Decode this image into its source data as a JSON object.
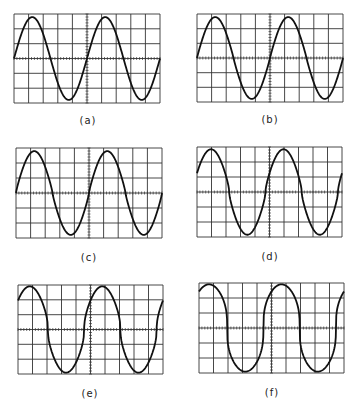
{
  "figure": {
    "grid": {
      "columns": 10,
      "rows": 6
    },
    "colors": {
      "grid": "#333333",
      "trace": "#111111",
      "background": "#ffffff"
    },
    "panels": [
      {
        "id": "a",
        "label": "(a)",
        "x": 14,
        "y": 14,
        "w": 146,
        "h": 89,
        "label_x": 88,
        "label_y": 115,
        "phase": 0.0,
        "amp": 0.93,
        "shape": 0.0
      },
      {
        "id": "b",
        "label": "(b)",
        "x": 197,
        "y": 14,
        "w": 146,
        "h": 88,
        "label_x": 270,
        "label_y": 114,
        "phase": 0.0,
        "amp": 0.93,
        "shape": 0.15
      },
      {
        "id": "c",
        "label": "(c)",
        "x": 16,
        "y": 148,
        "w": 146,
        "h": 90,
        "label_x": 89,
        "label_y": 252,
        "phase": 0.0,
        "amp": 0.93,
        "shape": 0.25
      },
      {
        "id": "d",
        "label": "(d)",
        "x": 197,
        "y": 147,
        "w": 145,
        "h": 90,
        "label_x": 270,
        "label_y": 251,
        "phase": 0.35,
        "amp": 0.95,
        "shape": 0.4
      },
      {
        "id": "e",
        "label": "(e)",
        "x": 18,
        "y": 285,
        "w": 145,
        "h": 89,
        "label_x": 90,
        "label_y": 388,
        "phase": 0.55,
        "amp": 0.97,
        "shape": 0.6
      },
      {
        "id": "f",
        "label": "(f)",
        "x": 199,
        "y": 283,
        "w": 145,
        "h": 90,
        "label_x": 272,
        "label_y": 387,
        "phase": 0.7,
        "amp": 0.97,
        "shape": 0.85
      }
    ]
  }
}
